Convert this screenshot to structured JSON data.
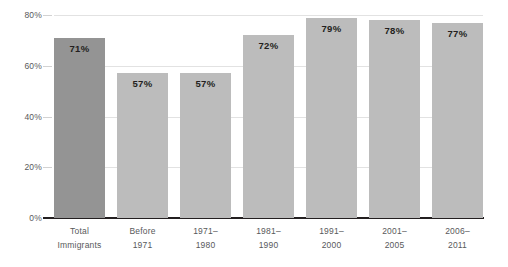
{
  "chart_data": {
    "type": "bar",
    "title": "",
    "subtitle": "",
    "xlabel": "",
    "ylabel": "",
    "ylim": [
      0,
      80
    ],
    "grid": true,
    "legend": "none",
    "categories": [
      "Total Immigrants",
      "Before 1971",
      "1971–1980",
      "1981–1990",
      "1991–2000",
      "2001–2005",
      "2006–2011"
    ],
    "category_lines": [
      [
        "Total",
        "Immigrants"
      ],
      [
        "Before",
        "1971"
      ],
      [
        "1971–",
        "1980"
      ],
      [
        "1981–",
        "1990"
      ],
      [
        "1991–",
        "2000"
      ],
      [
        "2001–",
        "2005"
      ],
      [
        "2006–",
        "2011"
      ]
    ],
    "values": [
      71,
      57,
      57,
      72,
      79,
      78,
      77
    ],
    "value_labels": [
      "71%",
      "57%",
      "57%",
      "72%",
      "79%",
      "78%",
      "77%"
    ],
    "ytick_values": [
      0,
      20,
      40,
      60,
      80
    ],
    "ytick_labels": [
      "0%",
      "20%",
      "40%",
      "60%",
      "80%"
    ],
    "bar_colors": [
      "#949494",
      "#bcbcbc",
      "#bcbcbc",
      "#bcbcbc",
      "#bcbcbc",
      "#bcbcbc",
      "#bcbcbc"
    ],
    "highlight_index": 0,
    "colors": {
      "bar_default": "#bcbcbc",
      "bar_highlight": "#949494",
      "gridline": "#e2e2e2",
      "axis": "#231f20",
      "tick_text": "#58595b",
      "value_text": "#231f20",
      "background": "#ffffff"
    }
  }
}
